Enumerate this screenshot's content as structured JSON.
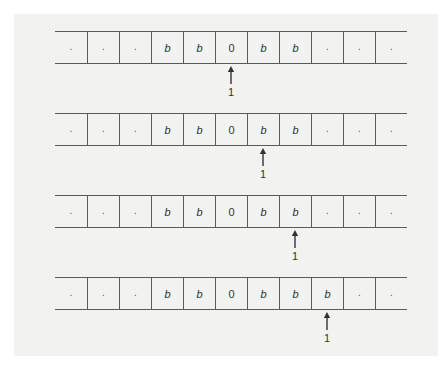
{
  "colors": {
    "background": "#ffffff",
    "panel": "#f2f2f1",
    "line": "#5a5a5a",
    "text": "#333333"
  },
  "tapes": [
    {
      "cells": [
        ".",
        ".",
        ".",
        "b",
        "b",
        "0",
        "b",
        "b",
        ".",
        ".",
        "."
      ],
      "head_position": 5,
      "head_label": "1"
    },
    {
      "cells": [
        ".",
        ".",
        ".",
        "b",
        "b",
        "0",
        "b",
        "b",
        ".",
        ".",
        "."
      ],
      "head_position": 6,
      "head_label": "1"
    },
    {
      "cells": [
        ".",
        ".",
        ".",
        "b",
        "b",
        "0",
        "b",
        "b",
        ".",
        ".",
        "."
      ],
      "head_position": 7,
      "head_label": "1"
    },
    {
      "cells": [
        ".",
        ".",
        ".",
        "b",
        "b",
        "0",
        "b",
        "b",
        "b",
        ".",
        "."
      ],
      "head_position": 8,
      "head_label": "1"
    }
  ]
}
